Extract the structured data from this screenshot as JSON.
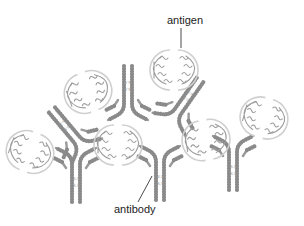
{
  "diagram": {
    "type": "immune-complex lattice",
    "labels": {
      "antigen": "antigen",
      "antibody": "antibody"
    },
    "disulfide_bond_label": "S-S",
    "colors": {
      "background": "#ffffff",
      "antibody_chain": "#8a8a8a",
      "antigen_helix": "#9d9d9d",
      "antigen_outline": "#cfcfcf",
      "label_text": "#222222"
    },
    "counts": {
      "antibodies": 6,
      "antigens": 6
    }
  }
}
